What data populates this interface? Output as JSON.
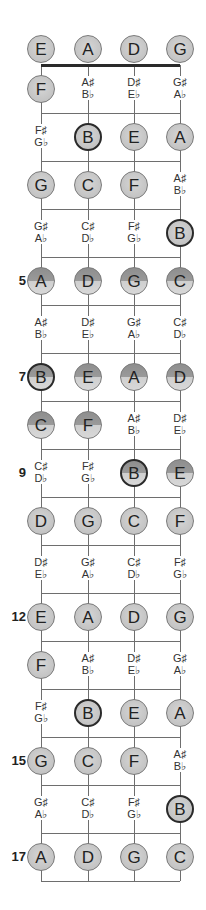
{
  "strings": [
    "E",
    "A",
    "D",
    "G"
  ],
  "open_notes": [
    {
      "label": "E",
      "style": "plain",
      "root": false
    },
    {
      "label": "A",
      "style": "plain",
      "root": false
    },
    {
      "label": "D",
      "style": "plain",
      "root": false
    },
    {
      "label": "G",
      "style": "plain",
      "root": false
    }
  ],
  "frets": [
    {
      "fret": 1,
      "marker": "",
      "cells": [
        {
          "type": "note",
          "label": "F",
          "style": "plain",
          "root": false
        },
        {
          "type": "acc",
          "sharp": "A♯",
          "flat": "B♭"
        },
        {
          "type": "acc",
          "sharp": "D♯",
          "flat": "E♭"
        },
        {
          "type": "acc",
          "sharp": "G♯",
          "flat": "A♭"
        }
      ]
    },
    {
      "fret": 2,
      "marker": "",
      "cells": [
        {
          "type": "acc",
          "sharp": "F♯",
          "flat": "G♭"
        },
        {
          "type": "note",
          "label": "B",
          "style": "plain",
          "root": true
        },
        {
          "type": "note",
          "label": "E",
          "style": "plain",
          "root": false
        },
        {
          "type": "note",
          "label": "A",
          "style": "plain",
          "root": false
        }
      ]
    },
    {
      "fret": 3,
      "marker": "",
      "cells": [
        {
          "type": "note",
          "label": "G",
          "style": "plain",
          "root": false
        },
        {
          "type": "note",
          "label": "C",
          "style": "plain",
          "root": false
        },
        {
          "type": "note",
          "label": "F",
          "style": "plain",
          "root": false
        },
        {
          "type": "acc",
          "sharp": "A♯",
          "flat": "B♭"
        }
      ]
    },
    {
      "fret": 4,
      "marker": "",
      "cells": [
        {
          "type": "acc",
          "sharp": "G♯",
          "flat": "A♭"
        },
        {
          "type": "acc",
          "sharp": "C♯",
          "flat": "D♭"
        },
        {
          "type": "acc",
          "sharp": "F♯",
          "flat": "G♭"
        },
        {
          "type": "note",
          "label": "B",
          "style": "plain",
          "root": true
        }
      ]
    },
    {
      "fret": 5,
      "marker": "5",
      "cells": [
        {
          "type": "note",
          "label": "A",
          "style": "split",
          "root": false
        },
        {
          "type": "note",
          "label": "D",
          "style": "split",
          "root": false
        },
        {
          "type": "note",
          "label": "G",
          "style": "split",
          "root": false
        },
        {
          "type": "note",
          "label": "C",
          "style": "split",
          "root": false
        }
      ]
    },
    {
      "fret": 6,
      "marker": "",
      "cells": [
        {
          "type": "acc",
          "sharp": "A♯",
          "flat": "B♭"
        },
        {
          "type": "acc",
          "sharp": "D♯",
          "flat": "E♭"
        },
        {
          "type": "acc",
          "sharp": "G♯",
          "flat": "A♭"
        },
        {
          "type": "acc",
          "sharp": "C♯",
          "flat": "D♭"
        }
      ]
    },
    {
      "fret": 7,
      "marker": "7",
      "cells": [
        {
          "type": "note",
          "label": "B",
          "style": "split",
          "root": true
        },
        {
          "type": "note",
          "label": "E",
          "style": "split",
          "root": false
        },
        {
          "type": "note",
          "label": "A",
          "style": "split",
          "root": false
        },
        {
          "type": "note",
          "label": "D",
          "style": "split",
          "root": false
        }
      ]
    },
    {
      "fret": 8,
      "marker": "",
      "cells": [
        {
          "type": "note",
          "label": "C",
          "style": "split",
          "root": false
        },
        {
          "type": "note",
          "label": "F",
          "style": "split",
          "root": false
        },
        {
          "type": "acc",
          "sharp": "A♯",
          "flat": "B♭"
        },
        {
          "type": "acc",
          "sharp": "D♯",
          "flat": "E♭"
        }
      ]
    },
    {
      "fret": 9,
      "marker": "9",
      "cells": [
        {
          "type": "acc",
          "sharp": "C♯",
          "flat": "D♭"
        },
        {
          "type": "acc",
          "sharp": "F♯",
          "flat": "G♭"
        },
        {
          "type": "note",
          "label": "B",
          "style": "split",
          "root": true
        },
        {
          "type": "note",
          "label": "E",
          "style": "split",
          "root": false
        }
      ]
    },
    {
      "fret": 10,
      "marker": "",
      "cells": [
        {
          "type": "note",
          "label": "D",
          "style": "plain",
          "root": false
        },
        {
          "type": "note",
          "label": "G",
          "style": "plain",
          "root": false
        },
        {
          "type": "note",
          "label": "C",
          "style": "plain",
          "root": false
        },
        {
          "type": "note",
          "label": "F",
          "style": "plain",
          "root": false
        }
      ]
    },
    {
      "fret": 11,
      "marker": "",
      "cells": [
        {
          "type": "acc",
          "sharp": "D♯",
          "flat": "E♭"
        },
        {
          "type": "acc",
          "sharp": "G♯",
          "flat": "A♭"
        },
        {
          "type": "acc",
          "sharp": "C♯",
          "flat": "D♭"
        },
        {
          "type": "acc",
          "sharp": "F♯",
          "flat": "G♭"
        }
      ]
    },
    {
      "fret": 12,
      "marker": "12",
      "cells": [
        {
          "type": "note",
          "label": "E",
          "style": "plain",
          "root": false
        },
        {
          "type": "note",
          "label": "A",
          "style": "plain",
          "root": false
        },
        {
          "type": "note",
          "label": "D",
          "style": "plain",
          "root": false
        },
        {
          "type": "note",
          "label": "G",
          "style": "plain",
          "root": false
        }
      ]
    },
    {
      "fret": 13,
      "marker": "",
      "cells": [
        {
          "type": "note",
          "label": "F",
          "style": "plain",
          "root": false
        },
        {
          "type": "acc",
          "sharp": "A♯",
          "flat": "B♭"
        },
        {
          "type": "acc",
          "sharp": "D♯",
          "flat": "E♭"
        },
        {
          "type": "acc",
          "sharp": "G♯",
          "flat": "A♭"
        }
      ]
    },
    {
      "fret": 14,
      "marker": "",
      "cells": [
        {
          "type": "acc",
          "sharp": "F♯",
          "flat": "G♭"
        },
        {
          "type": "note",
          "label": "B",
          "style": "plain",
          "root": true
        },
        {
          "type": "note",
          "label": "E",
          "style": "plain",
          "root": false
        },
        {
          "type": "note",
          "label": "A",
          "style": "plain",
          "root": false
        }
      ]
    },
    {
      "fret": 15,
      "marker": "15",
      "cells": [
        {
          "type": "note",
          "label": "G",
          "style": "plain",
          "root": false
        },
        {
          "type": "note",
          "label": "C",
          "style": "plain",
          "root": false
        },
        {
          "type": "note",
          "label": "F",
          "style": "plain",
          "root": false
        },
        {
          "type": "acc",
          "sharp": "A♯",
          "flat": "B♭"
        }
      ]
    },
    {
      "fret": 16,
      "marker": "",
      "cells": [
        {
          "type": "acc",
          "sharp": "G♯",
          "flat": "A♭"
        },
        {
          "type": "acc",
          "sharp": "C♯",
          "flat": "D♭"
        },
        {
          "type": "acc",
          "sharp": "F♯",
          "flat": "G♭"
        },
        {
          "type": "note",
          "label": "B",
          "style": "plain",
          "root": true
        }
      ]
    },
    {
      "fret": 17,
      "marker": "17",
      "cells": [
        {
          "type": "note",
          "label": "A",
          "style": "plain",
          "root": false
        },
        {
          "type": "note",
          "label": "D",
          "style": "plain",
          "root": false
        },
        {
          "type": "note",
          "label": "G",
          "style": "plain",
          "root": false
        },
        {
          "type": "note",
          "label": "C",
          "style": "plain",
          "root": false
        }
      ]
    }
  ]
}
